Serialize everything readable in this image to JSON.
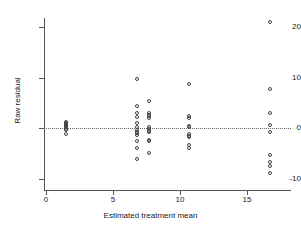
{
  "chart_data": {
    "type": "scatter",
    "title": "",
    "xlabel": "Estimated treatment mean",
    "ylabel": "Raw residual",
    "xlim": [
      -0.6,
      18.0
    ],
    "ylim": [
      -13.0,
      22.5
    ],
    "xticks": [
      0,
      5,
      10,
      15
    ],
    "xtick_labels": [
      "0",
      "5",
      "10",
      "15"
    ],
    "yticks": [
      20,
      10,
      0,
      -10
    ],
    "ytick_labels": [
      "20",
      "10",
      "0",
      "-10"
    ],
    "grid": false,
    "legend": null,
    "marker": "open-circle",
    "reference_lines": [
      {
        "name": "zero-residual-line",
        "orientation": "horizontal",
        "y": 0,
        "style": "dotted"
      }
    ],
    "points": [
      {
        "x": 1.5,
        "y": 1.1
      },
      {
        "x": 1.5,
        "y": 0.9
      },
      {
        "x": 1.5,
        "y": 0.7
      },
      {
        "x": 1.5,
        "y": 0.5
      },
      {
        "x": 1.5,
        "y": 0.3
      },
      {
        "x": 1.5,
        "y": 0.1
      },
      {
        "x": 1.5,
        "y": -0.1
      },
      {
        "x": 1.5,
        "y": -0.3
      },
      {
        "x": 1.5,
        "y": -1.2
      },
      {
        "x": 6.8,
        "y": 9.8
      },
      {
        "x": 6.8,
        "y": 4.4
      },
      {
        "x": 6.8,
        "y": 2.9
      },
      {
        "x": 6.8,
        "y": 2.1
      },
      {
        "x": 6.8,
        "y": 1.0
      },
      {
        "x": 6.8,
        "y": 0.1
      },
      {
        "x": 6.8,
        "y": -0.3
      },
      {
        "x": 6.8,
        "y": -0.7
      },
      {
        "x": 6.8,
        "y": -1.0
      },
      {
        "x": 6.8,
        "y": -1.3
      },
      {
        "x": 6.8,
        "y": -2.6
      },
      {
        "x": 6.8,
        "y": -4.0
      },
      {
        "x": 6.8,
        "y": -6.2
      },
      {
        "x": 7.7,
        "y": 5.4
      },
      {
        "x": 7.7,
        "y": 2.9
      },
      {
        "x": 7.7,
        "y": 2.6
      },
      {
        "x": 7.7,
        "y": 2.3
      },
      {
        "x": 7.7,
        "y": 1.9
      },
      {
        "x": 7.7,
        "y": 0.2
      },
      {
        "x": 7.7,
        "y": -0.2
      },
      {
        "x": 7.7,
        "y": -0.5
      },
      {
        "x": 7.7,
        "y": -0.8
      },
      {
        "x": 7.7,
        "y": -2.3
      },
      {
        "x": 7.7,
        "y": -2.6
      },
      {
        "x": 7.7,
        "y": -5.0
      },
      {
        "x": 10.7,
        "y": 8.8
      },
      {
        "x": 10.7,
        "y": 2.4
      },
      {
        "x": 10.7,
        "y": 2.0
      },
      {
        "x": 10.7,
        "y": 0.4
      },
      {
        "x": 10.7,
        "y": 0.1
      },
      {
        "x": 10.7,
        "y": -1.2
      },
      {
        "x": 10.7,
        "y": -1.5
      },
      {
        "x": 10.7,
        "y": -1.8
      },
      {
        "x": 10.7,
        "y": -3.4
      },
      {
        "x": 10.7,
        "y": -3.9
      },
      {
        "x": 16.7,
        "y": 21.0
      },
      {
        "x": 16.7,
        "y": 7.7
      },
      {
        "x": 16.7,
        "y": 3.0
      },
      {
        "x": 16.7,
        "y": 0.6
      },
      {
        "x": 16.7,
        "y": -0.8
      },
      {
        "x": 16.7,
        "y": -5.4
      },
      {
        "x": 16.7,
        "y": -6.7
      },
      {
        "x": 16.7,
        "y": -7.6
      },
      {
        "x": 16.7,
        "y": -9.0
      }
    ]
  }
}
